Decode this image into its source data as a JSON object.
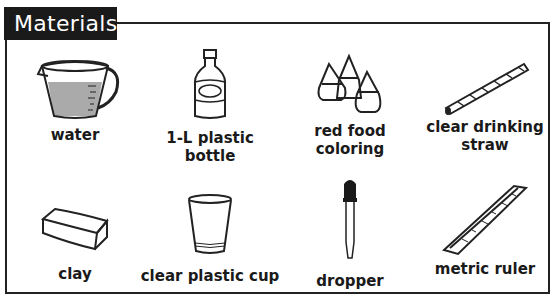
{
  "title": "Materials",
  "colors": {
    "title_bg": "#1a1a1a",
    "title_text": "#ffffff",
    "border": "#222222",
    "water": "#aaaaaa"
  },
  "items": [
    {
      "label": "water",
      "icon": "measuring-cup-icon"
    },
    {
      "label": "1-L plastic bottle",
      "icon": "bottle-icon"
    },
    {
      "label": "red food coloring",
      "label_lines": [
        "red food",
        "coloring"
      ],
      "icon": "food-coloring-bottles-icon"
    },
    {
      "label": "clear drinking straw",
      "label_lines": [
        "clear drinking",
        "straw"
      ],
      "icon": "straw-icon"
    },
    {
      "label": "clay",
      "icon": "clay-block-icon"
    },
    {
      "label": "clear plastic cup",
      "icon": "plastic-cup-icon"
    },
    {
      "label": "dropper",
      "icon": "dropper-icon"
    },
    {
      "label": "metric ruler",
      "icon": "ruler-icon"
    }
  ]
}
